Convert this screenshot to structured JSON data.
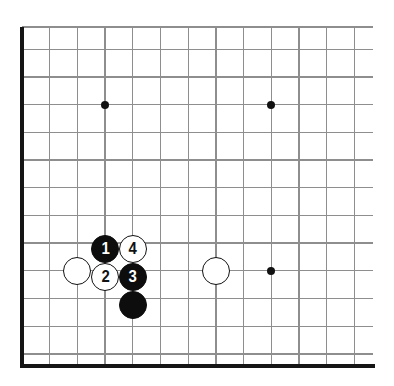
{
  "figure": {
    "kind": "go-board-diagram",
    "board_style": "partial board, lower-left corner view, cropped at top and right"
  },
  "colors": {
    "background": "#ffffff",
    "grid_line": "#8e8e8e",
    "board_edge": "#151515",
    "black_stone": "#0d0d0d",
    "white_stone": "#ffffff",
    "stone_outline": "#111111",
    "hoshi": "#111111",
    "black_label_text": "#ffffff",
    "white_label_text": "#111111"
  },
  "geometry": {
    "cell_size": 27.7,
    "origin_x": 22,
    "origin_y": 27,
    "columns": 13,
    "rows": 13,
    "stone_diameter": 28,
    "hoshi_diameter": 8,
    "edge_thickness": 4,
    "grid_line_thickness": 1.4,
    "grid_right_extent": 373,
    "board_bottom_y": 366
  },
  "vertical_lines": [
    22,
    49.7,
    77.4,
    105.1,
    132.8,
    160.5,
    188.2,
    215.9,
    243.6,
    271.3,
    299,
    326.7,
    354.4
  ],
  "horizontal_lines": [
    27,
    49.2,
    76.9,
    104.6,
    132.3,
    160,
    187.7,
    215.4,
    243.1,
    270.8,
    298.5,
    326.2,
    353.9
  ],
  "star_points": [
    {
      "name": "hoshi-upper-left",
      "x": 105.1,
      "y": 104.6
    },
    {
      "name": "hoshi-upper-right",
      "x": 271.3,
      "y": 104.6
    },
    {
      "name": "hoshi-lower-right",
      "x": 271.3,
      "y": 270.8
    }
  ],
  "stones": [
    {
      "id": "stone-white-left",
      "color": "white",
      "label": "",
      "x": 77.4,
      "y": 270.8
    },
    {
      "id": "stone-white-right",
      "color": "white",
      "label": "",
      "x": 215.9,
      "y": 270.8
    },
    {
      "id": "stone-black-move-1",
      "color": "black",
      "label": "1",
      "x": 105.1,
      "y": 248.5
    },
    {
      "id": "stone-white-move-4",
      "color": "white",
      "label": "4",
      "x": 132.8,
      "y": 248.5
    },
    {
      "id": "stone-white-move-2",
      "color": "white",
      "label": "2",
      "x": 105.1,
      "y": 276.5
    },
    {
      "id": "stone-black-move-3",
      "color": "black",
      "label": "3",
      "x": 132.8,
      "y": 276.5
    },
    {
      "id": "stone-black-lower",
      "color": "black",
      "label": "",
      "x": 132.8,
      "y": 304.5
    }
  ]
}
